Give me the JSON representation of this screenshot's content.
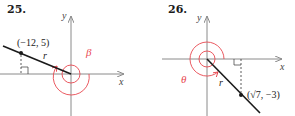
{
  "figures": [
    {
      "number": "25.",
      "x_axis_label": "x",
      "y_axis_label": "y",
      "point_label": "(−12, 5)",
      "point": {
        "x": -12,
        "y": 5
      },
      "radius_label": "r",
      "angle_label": "β",
      "quadrant": "II"
    },
    {
      "number": "26.",
      "x_axis_label": "x",
      "y_axis_label": "y",
      "point_label": "(√7, −3)",
      "point": {
        "x": "√7",
        "y": -3
      },
      "radius_label": "r",
      "angle_label": "θ",
      "quadrant": "IV"
    }
  ],
  "colors": {
    "axis": "#8a8a8a",
    "terminal_side": "#1a1a1a",
    "angle_arc": "#e8474f",
    "dashed": "#333333"
  }
}
